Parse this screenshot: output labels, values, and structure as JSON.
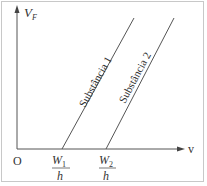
{
  "diagram": {
    "y_axis_label": "V",
    "y_axis_subscript": "F",
    "x_axis_label": "v",
    "origin_label": "O",
    "lines": [
      {
        "label": "Substância 1",
        "x_intercept_num": "W",
        "x_intercept_sub": "1",
        "x_intercept_den": "h"
      },
      {
        "label": "Substância 2",
        "x_intercept_num": "W",
        "x_intercept_sub": "2",
        "x_intercept_den": "h"
      }
    ],
    "colors": {
      "line": "#555555",
      "border": "#c8c8c8",
      "text": "#333333"
    }
  }
}
